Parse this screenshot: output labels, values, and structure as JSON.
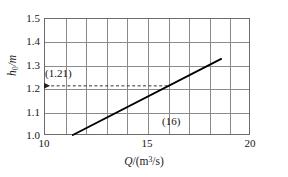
{
  "figure": {
    "name": "rating-curve",
    "background": "#ffffff"
  },
  "chart_data": {
    "type": "line",
    "title": "",
    "subtitle": "",
    "xlabel": "Q /(m³/s)",
    "ylabel": "h₀/m",
    "xlabel_parts": {
      "symbol": "Q",
      "units": "/(m",
      "exponent": "3",
      "units_tail": "/s)"
    },
    "ylabel_parts": {
      "symbol": "h",
      "subscript": "0",
      "units": "/m"
    },
    "xlim": [
      10,
      20
    ],
    "ylim": [
      1.0,
      1.5
    ],
    "xticks": [
      10,
      11,
      12,
      13,
      14,
      15,
      16,
      17,
      18,
      19,
      20
    ],
    "xtick_labels": [
      "10",
      "",
      "",
      "",
      "",
      "15",
      "",
      "",
      "",
      "",
      "20"
    ],
    "yticks": [
      1.0,
      1.1,
      1.2,
      1.3,
      1.4,
      1.5
    ],
    "ytick_labels": [
      "1.0",
      "1.1",
      "1.2",
      "1.3",
      "1.4",
      "1.5"
    ],
    "grid": true,
    "grid_color": "#8a8a8a",
    "frame_color": "#6b6b6b",
    "legend": null,
    "series": [
      {
        "name": "rating-curve",
        "color": "#000000",
        "style": "solid",
        "x": [
          11.4,
          18.6
        ],
        "y": [
          1.0,
          1.325
        ]
      }
    ],
    "annotations": [
      {
        "name": "head-readout",
        "label": "(1.21)",
        "type": "dashed-arrow-horizontal",
        "y": 1.21,
        "x_from": 16.0,
        "x_to": 10.0,
        "arrow_at": "left",
        "color": "#333333"
      },
      {
        "name": "discharge-readout",
        "label": "(16)",
        "type": "text",
        "x": 16.0,
        "y": 1.04,
        "color": "#141414"
      }
    ]
  },
  "ticks": {
    "y": [
      {
        "value": 1.5,
        "label": "1.5"
      },
      {
        "value": 1.4,
        "label": "1.4"
      },
      {
        "value": 1.3,
        "label": "1.3"
      },
      {
        "value": 1.2,
        "label": "1.2"
      },
      {
        "value": 1.1,
        "label": "1.1"
      },
      {
        "value": 1.0,
        "label": "1.0"
      }
    ],
    "x": [
      {
        "value": 10,
        "label": "10"
      },
      {
        "value": 15,
        "label": "15"
      },
      {
        "value": 20,
        "label": "20"
      }
    ]
  },
  "annotations": {
    "head_value": "(1.21)",
    "discharge_value": "(16)"
  }
}
